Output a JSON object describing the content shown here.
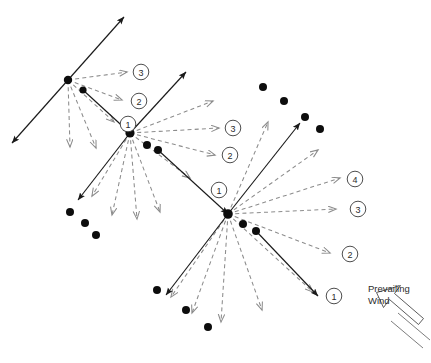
{
  "diagram": {
    "annotation": {
      "wind_label_line1": "Prevailing",
      "wind_label_line2": "Wind",
      "wind_icon_name": "block-arrow-icon"
    },
    "colors": {
      "solid_stroke": "#1a1a1a",
      "dashed_stroke": "#8c8c8c",
      "dot_fill": "#0d0d0d",
      "circle_stroke": "#3a3a3a",
      "background": "#ffffff",
      "wind_stroke": "#4a4a4a"
    },
    "nodes": [
      {
        "id": "origin-left",
        "x": 68,
        "y": 80,
        "r": 4.2
      },
      {
        "id": "origin-center",
        "x": 130,
        "y": 133,
        "r": 4.6
      },
      {
        "id": "origin-right",
        "x": 228,
        "y": 214,
        "r": 4.8
      }
    ],
    "node_companion_dots": [
      {
        "near": "origin-left",
        "x": 83,
        "y": 90,
        "r": 3.6
      },
      {
        "near": "origin-center",
        "x": 147,
        "y": 145,
        "r": 4.0
      },
      {
        "near": "origin-center",
        "x": 158,
        "y": 150,
        "r": 4.0
      },
      {
        "near": "origin-right",
        "x": 243,
        "y": 224,
        "r": 4.0
      },
      {
        "near": "origin-right",
        "x": 256,
        "y": 231,
        "r": 4.0
      }
    ],
    "scatter_dots": [
      {
        "group": "bottom-left-arc",
        "x": 70,
        "y": 212,
        "r": 4.0
      },
      {
        "group": "bottom-left-arc",
        "x": 85,
        "y": 223,
        "r": 4.0
      },
      {
        "group": "bottom-left-arc",
        "x": 96,
        "y": 235,
        "r": 4.0
      },
      {
        "group": "bottom-mid-arc",
        "x": 157,
        "y": 290,
        "r": 4.0
      },
      {
        "group": "bottom-mid-arc",
        "x": 186,
        "y": 310,
        "r": 4.0
      },
      {
        "group": "bottom-mid-arc",
        "x": 208,
        "y": 327,
        "r": 4.0
      },
      {
        "group": "top-right-arc",
        "x": 263,
        "y": 87,
        "r": 4.0
      },
      {
        "group": "top-right-arc",
        "x": 284,
        "y": 101,
        "r": 4.0
      },
      {
        "group": "top-right-arc",
        "x": 305,
        "y": 117,
        "r": 4.0
      },
      {
        "group": "top-right-arc",
        "x": 320,
        "y": 129,
        "r": 4.0
      }
    ],
    "solid_vectors": [
      {
        "name": "left-node-ne-head",
        "x1": 68,
        "y1": 80,
        "x2": 124,
        "y2": 17,
        "arrow": "end"
      },
      {
        "name": "left-node-sw-head",
        "x1": 68,
        "y1": 80,
        "x2": 12,
        "y2": 143,
        "arrow": "end"
      },
      {
        "name": "left-to-center-spread",
        "x1": 83,
        "y1": 90,
        "x2": 130,
        "y2": 133,
        "arrow": "end"
      },
      {
        "name": "center-node-ne-head",
        "x1": 130,
        "y1": 133,
        "x2": 186,
        "y2": 72,
        "arrow": "end"
      },
      {
        "name": "center-node-sw-head",
        "x1": 130,
        "y1": 133,
        "x2": 78,
        "y2": 200,
        "arrow": "end"
      },
      {
        "name": "center-to-right-spread",
        "x1": 158,
        "y1": 150,
        "x2": 228,
        "y2": 214,
        "arrow": "end"
      },
      {
        "name": "right-node-ne-head",
        "x1": 228,
        "y1": 214,
        "x2": 300,
        "y2": 123,
        "arrow": "end"
      },
      {
        "name": "right-node-sw-head",
        "x1": 228,
        "y1": 214,
        "x2": 166,
        "y2": 295,
        "arrow": "end"
      },
      {
        "name": "right-downwind-spread",
        "x1": 256,
        "y1": 231,
        "x2": 318,
        "y2": 296,
        "arrow": "end"
      }
    ],
    "dashed_vectors": [
      {
        "name": "left-fan-1",
        "x1": 68,
        "y1": 80,
        "x2": 127,
        "y2": 72
      },
      {
        "name": "left-fan-2",
        "x1": 68,
        "y1": 80,
        "x2": 122,
        "y2": 100
      },
      {
        "name": "left-fan-3",
        "x1": 68,
        "y1": 80,
        "x2": 114,
        "y2": 122
      },
      {
        "name": "left-fan-4",
        "x1": 68,
        "y1": 80,
        "x2": 96,
        "y2": 148
      },
      {
        "name": "left-fan-5",
        "x1": 68,
        "y1": 80,
        "x2": 70,
        "y2": 147
      },
      {
        "name": "center-fan-1",
        "x1": 130,
        "y1": 133,
        "x2": 213,
        "y2": 101
      },
      {
        "name": "center-fan-2",
        "x1": 130,
        "y1": 133,
        "x2": 219,
        "y2": 128
      },
      {
        "name": "center-fan-3",
        "x1": 130,
        "y1": 133,
        "x2": 215,
        "y2": 155
      },
      {
        "name": "center-fan-4",
        "x1": 130,
        "y1": 133,
        "x2": 190,
        "y2": 178
      },
      {
        "name": "center-fan-5",
        "x1": 130,
        "y1": 133,
        "x2": 160,
        "y2": 212
      },
      {
        "name": "center-fan-6",
        "x1": 130,
        "y1": 133,
        "x2": 137,
        "y2": 219
      },
      {
        "name": "center-fan-7",
        "x1": 130,
        "y1": 133,
        "x2": 112,
        "y2": 215
      },
      {
        "name": "center-fan-8",
        "x1": 130,
        "y1": 133,
        "x2": 92,
        "y2": 196
      },
      {
        "name": "right-fan-1",
        "x1": 228,
        "y1": 214,
        "x2": 268,
        "y2": 122
      },
      {
        "name": "right-fan-2",
        "x1": 228,
        "y1": 214,
        "x2": 318,
        "y2": 150
      },
      {
        "name": "right-fan-3",
        "x1": 228,
        "y1": 214,
        "x2": 340,
        "y2": 178
      },
      {
        "name": "right-fan-4",
        "x1": 228,
        "y1": 214,
        "x2": 336,
        "y2": 209
      },
      {
        "name": "right-fan-5",
        "x1": 228,
        "y1": 214,
        "x2": 330,
        "y2": 253
      },
      {
        "name": "right-fan-6",
        "x1": 228,
        "y1": 214,
        "x2": 313,
        "y2": 292
      },
      {
        "name": "right-fan-7",
        "x1": 228,
        "y1": 214,
        "x2": 262,
        "y2": 310
      },
      {
        "name": "right-fan-8",
        "x1": 228,
        "y1": 214,
        "x2": 221,
        "y2": 322
      },
      {
        "name": "right-fan-9",
        "x1": 228,
        "y1": 214,
        "x2": 192,
        "y2": 313
      },
      {
        "name": "right-fan-10",
        "x1": 228,
        "y1": 214,
        "x2": 171,
        "y2": 297
      }
    ],
    "circle_labels": [
      {
        "name": "label-left-3",
        "text": "3",
        "x": 141,
        "y": 72,
        "r": 7.8
      },
      {
        "name": "label-left-2",
        "text": "2",
        "x": 139,
        "y": 101,
        "r": 7.8
      },
      {
        "name": "label-left-1",
        "text": "1",
        "x": 128,
        "y": 124,
        "r": 7.8
      },
      {
        "name": "label-center-3",
        "text": "3",
        "x": 233,
        "y": 128,
        "r": 7.8
      },
      {
        "name": "label-center-2",
        "text": "2",
        "x": 230,
        "y": 155,
        "r": 7.8
      },
      {
        "name": "label-center-1",
        "text": "1",
        "x": 219,
        "y": 190,
        "r": 7.8
      },
      {
        "name": "label-right-4",
        "text": "4",
        "x": 355,
        "y": 179,
        "r": 7.8
      },
      {
        "name": "label-right-3",
        "text": "3",
        "x": 358,
        "y": 209,
        "r": 7.8
      },
      {
        "name": "label-right-2",
        "text": "2",
        "x": 350,
        "y": 254,
        "r": 7.8
      },
      {
        "name": "label-right-1",
        "text": "1",
        "x": 334,
        "y": 296,
        "r": 7.8
      }
    ]
  }
}
